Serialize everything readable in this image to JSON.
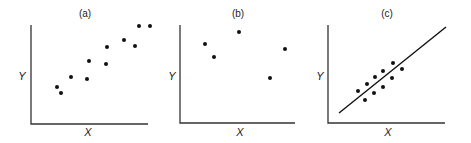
{
  "chart_data": [
    {
      "type": "scatter",
      "title": "(a)",
      "xlabel": "X",
      "ylabel": "Y",
      "grid": false,
      "description": "Positive linear trend, no fitted line",
      "points": [
        {
          "x": 57,
          "y": 87
        },
        {
          "x": 61,
          "y": 93
        },
        {
          "x": 71,
          "y": 77
        },
        {
          "x": 87,
          "y": 79
        },
        {
          "x": 89,
          "y": 61
        },
        {
          "x": 106,
          "y": 64
        },
        {
          "x": 107,
          "y": 47
        },
        {
          "x": 124,
          "y": 40
        },
        {
          "x": 135,
          "y": 46
        },
        {
          "x": 139,
          "y": 26
        },
        {
          "x": 150,
          "y": 26
        }
      ],
      "axes": {
        "origin": [
          31,
          124
        ],
        "x_end": 148,
        "y_top": 25
      }
    },
    {
      "type": "scatter",
      "title": "(b)",
      "xlabel": "X",
      "ylabel": "Y",
      "grid": false,
      "description": "No apparent relationship",
      "points": [
        {
          "x": 205,
          "y": 44
        },
        {
          "x": 214,
          "y": 57
        },
        {
          "x": 239,
          "y": 32
        },
        {
          "x": 270,
          "y": 78
        },
        {
          "x": 285,
          "y": 49
        }
      ],
      "axes": {
        "origin": [
          180,
          123
        ],
        "x_end": 295,
        "y_top": 25
      }
    },
    {
      "type": "scatter",
      "title": "(c)",
      "xlabel": "X",
      "ylabel": "Y",
      "grid": false,
      "description": "Points clustered around a fitted regression line",
      "points": [
        {
          "x": 358,
          "y": 91
        },
        {
          "x": 365,
          "y": 100
        },
        {
          "x": 367,
          "y": 84
        },
        {
          "x": 374,
          "y": 93
        },
        {
          "x": 375,
          "y": 77
        },
        {
          "x": 383,
          "y": 87
        },
        {
          "x": 383,
          "y": 71
        },
        {
          "x": 392,
          "y": 78
        },
        {
          "x": 393,
          "y": 63
        },
        {
          "x": 402,
          "y": 69
        }
      ],
      "fit_line": {
        "x1": 339,
        "y1": 113,
        "x2": 446,
        "y2": 27
      },
      "axes": {
        "origin": [
          328,
          123
        ],
        "x_end": 445,
        "y_top": 25
      }
    }
  ],
  "labels": {
    "a": {
      "title": "(a)",
      "x": "X",
      "y": "Y"
    },
    "b": {
      "title": "(b)",
      "x": "X",
      "y": "Y"
    },
    "c": {
      "title": "(c)",
      "x": "X",
      "y": "Y"
    }
  }
}
